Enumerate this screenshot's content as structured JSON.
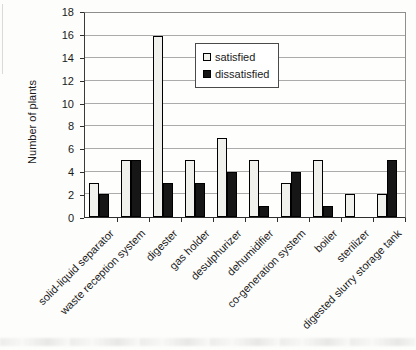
{
  "chart_data": {
    "type": "bar",
    "title": "",
    "xlabel": "",
    "ylabel": "Number of plants",
    "ylim": [
      0,
      18
    ],
    "ytick_step": 2,
    "yticks": [
      0,
      2,
      4,
      6,
      8,
      10,
      12,
      14,
      16,
      18
    ],
    "grid": true,
    "legend_position": "upper-middle-inside-plot",
    "categories": [
      "solid-liquid separator",
      "waste reception system",
      "digester",
      "gas holder",
      "desulphurizer",
      "dehumidifier",
      "co-generation system",
      "boiler",
      "sterilizer",
      "digested slurry storage tank"
    ],
    "series": [
      {
        "name": "satisfied",
        "fill": "#f0f0ec",
        "border": "#000000",
        "values": [
          3,
          5,
          16,
          5,
          7,
          5,
          3,
          5,
          2,
          2
        ]
      },
      {
        "name": "dissatisfied",
        "fill": "#161616",
        "border": "#000000",
        "values": [
          2,
          5,
          3,
          3,
          4,
          1,
          4,
          1,
          0,
          5
        ]
      }
    ]
  },
  "colors": {
    "gridline": "#ababab",
    "plot_border": "#8f8f8f",
    "axis": "#2e2e2e",
    "text": "#1a1a1a",
    "legend_border": "#4a4a4a",
    "legend_background": "#ffffff"
  }
}
